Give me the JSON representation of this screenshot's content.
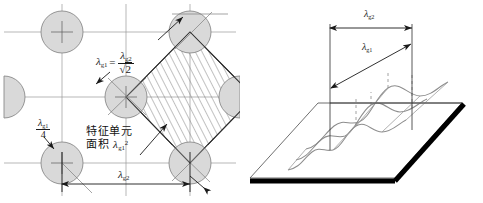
{
  "figure": {
    "background_color": "#ffffff",
    "line_color": "#3a3a3a",
    "circle_fill": "#d9d9d9",
    "circle_stroke": "#808080",
    "hatch_color": "#6e6e6e",
    "plate_edge_color": "#000000",
    "wave_color": "#8d8d8d"
  },
  "left_panel": {
    "name": "unit-cell-lattice",
    "lambda_symbol": "λ",
    "sub_g1": "g1",
    "sub_g2": "g2",
    "formula": {
      "lhs_symbol": "λ",
      "lhs_sub": "g1",
      "equals": "=",
      "numerator_symbol": "λ",
      "numerator_sub": "g2",
      "denominator_radical": "√",
      "denominator_value": "2"
    },
    "quarter_label": {
      "numerator_symbol": "λ",
      "numerator_sub": "g1",
      "denominator": "4"
    },
    "cell_caption": {
      "line1": "特征单元",
      "line2_prefix": "面积 ",
      "line2_symbol": "λ",
      "line2_sub": "g1",
      "line2_sup": "2"
    },
    "bottom_dimension": {
      "symbol": "λ",
      "sub": "g2"
    }
  },
  "right_panel": {
    "name": "corrugated-plate-3d",
    "horizontal_dimension": {
      "symbol": "λ",
      "sub": "g2"
    },
    "diagonal_dimension": {
      "symbol": "λ",
      "sub": "g1"
    }
  }
}
